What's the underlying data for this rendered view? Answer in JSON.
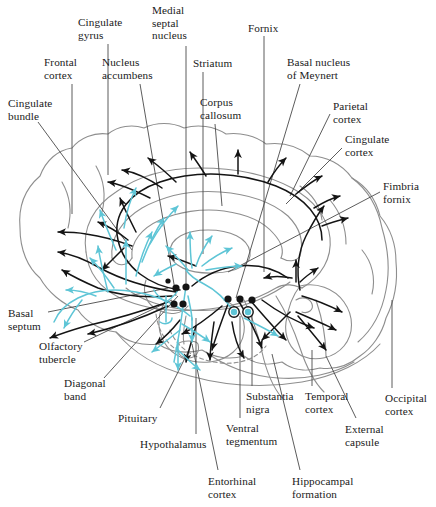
{
  "figure": {
    "colors": {
      "outline": "#8e8e8e",
      "cholinergic_black": "#141414",
      "dopaminergic_cyan": "#5ec5d6",
      "label_text": "#1a1a1a",
      "leader_line": "#4a4a4a",
      "background": "#ffffff"
    },
    "width": 436,
    "height": 507
  },
  "labels": [
    {
      "id": "cingulate-gyrus",
      "text": "Cingulate\ngyrus",
      "x": 78,
      "y": 16,
      "align": "left"
    },
    {
      "id": "medial-septal-nucleus",
      "text": "Medial\nseptal\nnucleus",
      "x": 152,
      "y": 4,
      "align": "left"
    },
    {
      "id": "fornix",
      "text": "Fornix",
      "x": 248,
      "y": 22,
      "align": "left"
    },
    {
      "id": "frontal-cortex",
      "text": "Frontal\ncortex",
      "x": 44,
      "y": 56,
      "align": "left"
    },
    {
      "id": "nucleus-accumbens",
      "text": "Nucleus\naccumbens",
      "x": 102,
      "y": 56,
      "align": "left"
    },
    {
      "id": "striatum",
      "text": "Striatum",
      "x": 193,
      "y": 57,
      "align": "left"
    },
    {
      "id": "basal-nucleus-of-meynert",
      "text": "Basal nucleus\nof Meynert",
      "x": 287,
      "y": 56,
      "align": "left"
    },
    {
      "id": "corpus-callosum",
      "text": "Corpus\ncallosum",
      "x": 200,
      "y": 96,
      "align": "left"
    },
    {
      "id": "parietal-cortex",
      "text": "Parietal\ncortex",
      "x": 333,
      "y": 100,
      "align": "left"
    },
    {
      "id": "cingulate-bundle",
      "text": "Cingulate\nbundle",
      "x": 8,
      "y": 97,
      "align": "left"
    },
    {
      "id": "cingulate-cortex",
      "text": "Cingulate\ncortex",
      "x": 345,
      "y": 133,
      "align": "left"
    },
    {
      "id": "fimbria-fornix",
      "text": "Fimbria\nfornix",
      "x": 383,
      "y": 180,
      "align": "left"
    },
    {
      "id": "basal-septum",
      "text": "Basal\nseptum",
      "x": 8,
      "y": 307,
      "align": "left"
    },
    {
      "id": "olfactory-tubercle",
      "text": "Olfactory\ntubercle",
      "x": 39,
      "y": 340,
      "align": "left"
    },
    {
      "id": "diagonal-band",
      "text": "Diagonal\nband",
      "x": 64,
      "y": 377,
      "align": "left"
    },
    {
      "id": "pituitary",
      "text": "Pituitary",
      "x": 118,
      "y": 412,
      "align": "left"
    },
    {
      "id": "hypothalamus",
      "text": "Hypothalamus",
      "x": 140,
      "y": 438,
      "align": "left"
    },
    {
      "id": "substantia-nigra",
      "text": "Substantia\nnigra",
      "x": 246,
      "y": 390,
      "align": "left"
    },
    {
      "id": "temporal-cortex",
      "text": "Temporal\ncortex",
      "x": 305,
      "y": 390,
      "align": "left"
    },
    {
      "id": "occipital-cortex",
      "text": "Occipital\ncortex",
      "x": 385,
      "y": 392,
      "align": "left"
    },
    {
      "id": "ventral-tegmentum",
      "text": "Ventral\ntegmentum",
      "x": 226,
      "y": 422,
      "align": "left"
    },
    {
      "id": "external-capsule",
      "text": "External\ncapsule",
      "x": 345,
      "y": 423,
      "align": "left"
    },
    {
      "id": "entorhinal-cortex",
      "text": "Entorhinal\ncortex",
      "x": 208,
      "y": 475,
      "align": "left"
    },
    {
      "id": "hippocampal-formation",
      "text": "Hippocampal\nformation",
      "x": 292,
      "y": 475,
      "align": "left"
    }
  ],
  "legend_semantics": {
    "black_pathway": "cholinergic projection",
    "cyan_pathway": "dopaminergic projection",
    "black_dot": "cholinergic cell body cluster",
    "cyan_circle": "dopaminergic nucleus"
  }
}
